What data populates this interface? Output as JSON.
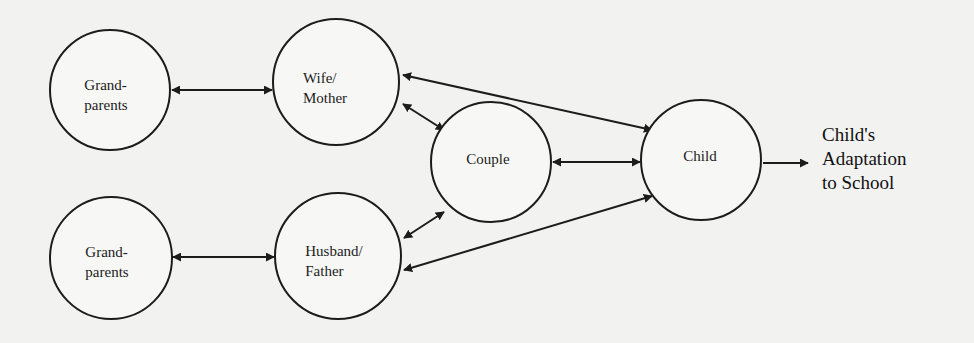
{
  "diagram": {
    "type": "family-systems-model",
    "colors": {
      "background": "#f2f2f0",
      "stroke": "#1c1c1c",
      "node_fill": "#f7f7f5"
    },
    "nodes": [
      {
        "id": "grandparents_top",
        "label": "Grand-\nparents",
        "cx": 110,
        "cy": 90,
        "r": 60
      },
      {
        "id": "wife_mother",
        "label": "Wife/\nMother",
        "cx": 336,
        "cy": 82,
        "r": 63
      },
      {
        "id": "grandparents_bottom",
        "label": "Grand-\nparents",
        "cx": 111,
        "cy": 258,
        "r": 61
      },
      {
        "id": "husband_father",
        "label": "Husband/\nFather",
        "cx": 338,
        "cy": 256,
        "r": 63
      },
      {
        "id": "couple",
        "label": "Couple",
        "cx": 491,
        "cy": 162,
        "r": 60
      },
      {
        "id": "child",
        "label": "Child",
        "cx": 701,
        "cy": 160,
        "r": 60
      }
    ],
    "edges": [
      {
        "from": "grandparents_top",
        "to": "wife_mother",
        "direction": "both"
      },
      {
        "from": "grandparents_bottom",
        "to": "husband_father",
        "direction": "both"
      },
      {
        "from": "wife_mother",
        "to": "couple",
        "direction": "both"
      },
      {
        "from": "husband_father",
        "to": "couple",
        "direction": "both"
      },
      {
        "from": "couple",
        "to": "child",
        "direction": "both"
      },
      {
        "from": "wife_mother",
        "to": "child",
        "direction": "both"
      },
      {
        "from": "husband_father",
        "to": "child",
        "direction": "both"
      },
      {
        "from": "child",
        "to": "outcome",
        "direction": "forward"
      }
    ],
    "outcome": {
      "label": "Child's\nAdaptation\nto School"
    }
  }
}
